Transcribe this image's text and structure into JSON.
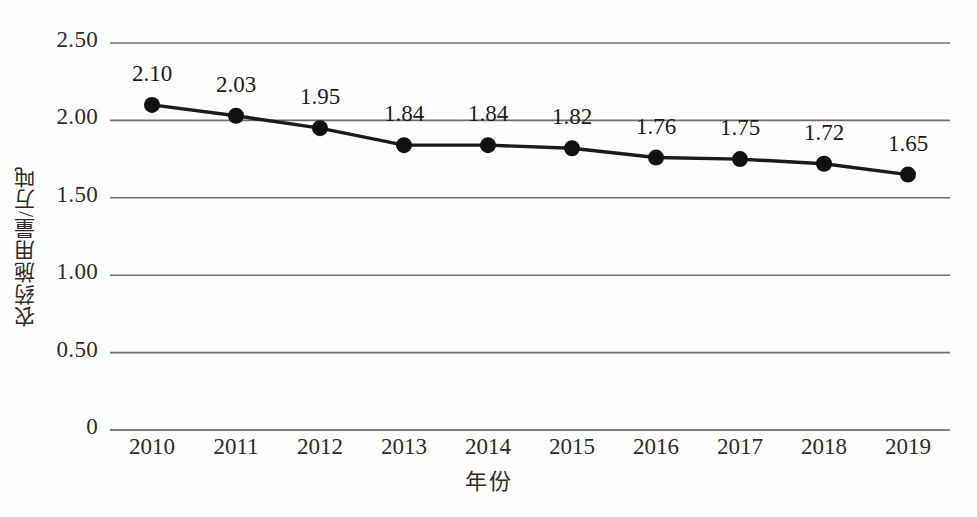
{
  "chart_data": {
    "type": "line",
    "title": "",
    "subtitle": "",
    "xlabel": "年份",
    "ylabel": "农药施用量/万吨",
    "categories": [
      "2010",
      "2011",
      "2012",
      "2013",
      "2014",
      "2015",
      "2016",
      "2017",
      "2018",
      "2019"
    ],
    "values": [
      2.1,
      2.03,
      1.95,
      1.84,
      1.84,
      1.82,
      1.76,
      1.75,
      1.72,
      1.65
    ],
    "data_labels": [
      "2.10",
      "2.03",
      "1.95",
      "1.84",
      "1.84",
      "1.82",
      "1.76",
      "1.75",
      "1.72",
      "1.65"
    ],
    "series": [
      {
        "name": "农药施用量",
        "values": [
          2.1,
          2.03,
          1.95,
          1.84,
          1.84,
          1.82,
          1.76,
          1.75,
          1.72,
          1.65
        ]
      }
    ],
    "ylim": [
      0,
      2.5
    ],
    "ytick_labels": [
      "2.50",
      "2.00",
      "1.50",
      "1.00",
      "0.50",
      "0"
    ],
    "ytick_values": [
      2.5,
      2.0,
      1.5,
      1.0,
      0.5,
      0
    ],
    "grid": true,
    "grid_axis": "y",
    "legend": false,
    "legend_position": "none",
    "marker": "circle",
    "colors": {
      "line": "#1b1b1b",
      "marker": "#111111",
      "grid": "#6e6e6e",
      "axis": "#555555",
      "text": "#2b2b2b",
      "background": "#fefefe"
    }
  }
}
